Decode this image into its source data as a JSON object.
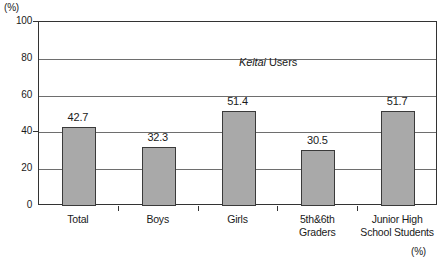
{
  "chart_data": {
    "type": "bar",
    "title": "Keitai Users",
    "title_italic_word": "Keitai",
    "title_rest": " Users",
    "categories": [
      "Total",
      "Boys",
      "Girls",
      "5th&6th Graders",
      "Junior High School Students"
    ],
    "category_lines": [
      [
        "Total"
      ],
      [
        "Boys"
      ],
      [
        "Girls"
      ],
      [
        "5th&6th",
        "Graders"
      ],
      [
        "Junior High",
        "School Students"
      ]
    ],
    "values": [
      42.7,
      32.3,
      51.4,
      30.5,
      51.7
    ],
    "value_labels": [
      "42.7",
      "32.3",
      "51.4",
      "30.5",
      "51.7"
    ],
    "xlabel": "",
    "ylabel": "(%)",
    "unit_top_left": "(%)",
    "unit_bottom_right": "(%)",
    "ylim": [
      0,
      100
    ],
    "yticks": [
      0,
      20,
      40,
      60,
      80,
      100
    ],
    "ytick_labels": [
      "0",
      "20",
      "40",
      "60",
      "80",
      "100"
    ],
    "grid": true,
    "gridlines_at": [
      20,
      40,
      60,
      80
    ],
    "legend": false,
    "legend_position": "none",
    "bar_color": "#a9a9a9",
    "bar_border_color": "#3a3a3a",
    "axis_color": "#333333",
    "grid_color": "#6e6e6e"
  }
}
